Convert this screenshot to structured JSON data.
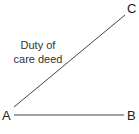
{
  "diagram": {
    "points": {
      "A": {
        "label": "A"
      },
      "B": {
        "label": "B"
      },
      "C": {
        "label": "C"
      }
    },
    "edges": [
      {
        "from": "A",
        "to": "B",
        "label": ""
      },
      {
        "from": "A",
        "to": "C",
        "label": "Duty of care deed"
      }
    ],
    "caption_line1": "Duty of",
    "caption_line2": "care deed",
    "line_color": "#444444"
  }
}
